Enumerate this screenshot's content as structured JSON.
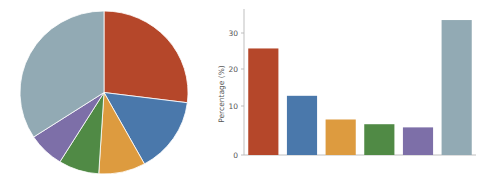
{
  "chart_data": [
    {
      "type": "pie",
      "title": "",
      "categories": [
        "Category 1",
        "Category 2",
        "Category 3",
        "Category 4",
        "Category 5",
        "Category 6"
      ],
      "values": [
        27.0,
        15.0,
        9.0,
        7.8,
        7.0,
        34.2
      ],
      "unit": "%",
      "start_angle_deg": 90,
      "direction": "clockwise",
      "legend": "none",
      "labels_shown": false,
      "colors": [
        "#b5472a",
        "#4a78ab",
        "#dd9b3f",
        "#508a45",
        "#7d6fa8",
        "#92aab4"
      ]
    },
    {
      "type": "bar",
      "title": "",
      "xlabel": "",
      "ylabel": "Percentage (%)",
      "categories": [
        "Category 1",
        "Category 2",
        "Category 3",
        "Category 4",
        "Category 5",
        "Category 6"
      ],
      "values": [
        27.0,
        15.0,
        9.0,
        7.8,
        7.0,
        34.2
      ],
      "ylim": [
        0,
        37
      ],
      "yticks": [
        0,
        10,
        20,
        30
      ],
      "ytick_labels": [
        "0",
        "10",
        "20",
        "30"
      ],
      "xtick_labels": [
        "",
        "",
        "",
        "",
        "",
        ""
      ],
      "grid": false,
      "legend": "none",
      "colors": [
        "#b5472a",
        "#4a78ab",
        "#dd9b3f",
        "#508a45",
        "#7d6fa8",
        "#92aab4"
      ]
    }
  ],
  "figure": {
    "background": "#ffffff",
    "axis_color": "#b8b8b8",
    "text_color": "#555555"
  },
  "bar_axis": {
    "ylabel": "Percentage (%)",
    "tick_0": "0",
    "tick_10": "10",
    "tick_20": "20",
    "tick_30": "30"
  }
}
